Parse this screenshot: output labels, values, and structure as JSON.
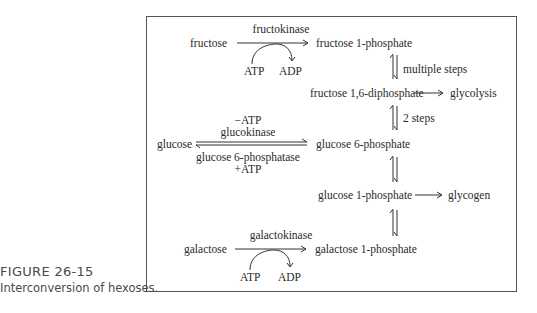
{
  "figure": {
    "number": "FIGURE 26-15",
    "caption": "Interconversion of hexoses."
  },
  "diagram": {
    "nodes": {
      "fructose": "fructose",
      "fructose_1p": "fructose 1-phosphate",
      "fructose_16dp": "fructose 1,6-diphosphate",
      "glycolysis": "glycolysis",
      "glucose": "glucose",
      "glucose_6p": "glucose 6-phosphate",
      "glucose_1p": "glucose 1-phosphate",
      "glycogen": "glycogen",
      "galactose": "galactose",
      "galactose_1p": "galactose 1-phosphate"
    },
    "edges": {
      "fructokinase": {
        "enzyme": "fructokinase",
        "cofactor_in": "ATP",
        "cofactor_out": "ADP"
      },
      "multiple_steps": "multiple steps",
      "two_steps": "2 steps",
      "glucokinase": {
        "above_top": "−ATP",
        "above": "glucokinase",
        "below": "glucose 6-phosphatase",
        "below_bottom": "+ATP"
      },
      "galactokinase": {
        "enzyme": "galactokinase",
        "cofactor_in": "ATP",
        "cofactor_out": "ADP"
      }
    }
  },
  "colors": {
    "text": "#2a2a2a",
    "border": "#555555",
    "caption": "#4a4a4a"
  }
}
